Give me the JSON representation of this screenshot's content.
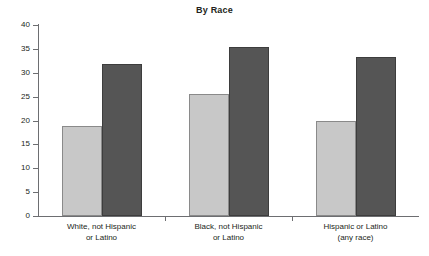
{
  "chart_data": {
    "type": "bar",
    "title": "By Race",
    "xlabel": "",
    "ylabel": "",
    "ylim": [
      0,
      40
    ],
    "ytick_step": 5,
    "yticks": [
      "40",
      "35",
      "30",
      "25",
      "20",
      "15",
      "10",
      "5",
      "0"
    ],
    "grid": false,
    "legend": "none",
    "categories": [
      "White, not Hispanic\nor Latino",
      "Black, not Hispanic\nor Latino",
      "Hispanic or Latino\n(any race)"
    ],
    "category_lines": [
      [
        "White, not Hispanic",
        "or Latino"
      ],
      [
        "Black, not Hispanic",
        "or Latino"
      ],
      [
        "Hispanic or Latino",
        "(any race)"
      ]
    ],
    "series": [
      {
        "name": "series-1",
        "color": "#c8c8c8",
        "values": [
          18.8,
          25.6,
          19.9
        ]
      },
      {
        "name": "series-2",
        "color": "#555555",
        "values": [
          31.8,
          35.4,
          33.3
        ]
      }
    ]
  },
  "colors": {
    "light_bar": "#c8c8c8",
    "dark_bar": "#555555",
    "axis": "#6d6e71",
    "text": "#231f20",
    "background": "#ffffff"
  }
}
